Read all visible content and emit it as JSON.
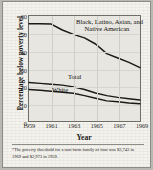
{
  "figure": {
    "ylabel": "Percentage below poverty level",
    "xlabel": "Year",
    "footnote": "*The poverty threshold for a non-farm family of four was $3,743 in 1969 and $2,973 in 1959.",
    "labels": {
      "minority": "Black, Latino, Asian, and Native American",
      "minority_line1": "Black, Latino, Asian, and",
      "minority_line2": "Native American",
      "total": "Total",
      "white": "White"
    },
    "ticks": {
      "y": [
        "0",
        "10",
        "20",
        "30",
        "40",
        "50",
        "60"
      ],
      "x": [
        "1959",
        "1961",
        "1963",
        "1965",
        "1967",
        "1969"
      ]
    },
    "colors": {
      "paper": "#f4f2ec",
      "plot_fill": "#e7e6e1",
      "axis": "#6e6e69",
      "line": "#1a1a18",
      "grid": "#cfcec8"
    }
  },
  "chart_data": {
    "type": "line",
    "title": "",
    "xlabel": "Year",
    "ylabel": "Percentage below poverty level",
    "xlim": [
      1959,
      1969
    ],
    "ylim": [
      0,
      60
    ],
    "grid": true,
    "legend": "in-plot labels",
    "x": [
      1959,
      1960,
      1961,
      1962,
      1963,
      1964,
      1965,
      1966,
      1967,
      1968,
      1969
    ],
    "series": [
      {
        "name": "Black, Latino, Asian, and Native American",
        "values": [
          55.5,
          55.5,
          55.4,
          52.0,
          49.5,
          47.5,
          44.0,
          38.5,
          36.0,
          33.5,
          30.5
        ]
      },
      {
        "name": "Total",
        "values": [
          22.0,
          21.5,
          21.0,
          20.5,
          19.5,
          18.0,
          16.0,
          14.5,
          13.5,
          12.7,
          12.0
        ]
      },
      {
        "name": "White",
        "values": [
          18.0,
          17.6,
          17.0,
          16.5,
          15.8,
          14.5,
          13.0,
          11.5,
          11.0,
          10.3,
          9.8
        ]
      }
    ],
    "annotations": [
      "*The poverty threshold for a non-farm family of four was $3,743 in 1969 and $2,973 in 1959."
    ]
  }
}
